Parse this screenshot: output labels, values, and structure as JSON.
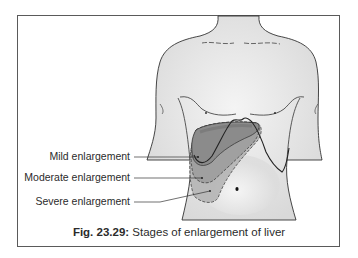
{
  "figure": {
    "caption_number": "Fig. 23.29:",
    "caption_text": "Stages of enlargement of liver",
    "labels": [
      {
        "id": "mild",
        "text": "Mild enlargement"
      },
      {
        "id": "moderate",
        "text": "Moderate enlargement"
      },
      {
        "id": "severe",
        "text": "Severe enlargement"
      }
    ],
    "colors": {
      "frame": "#5a5a5a",
      "skin": "#e6e6e6",
      "outline": "#333333",
      "liver_mild": "#8c8c8c",
      "liver_moderate": "#9e9e9e",
      "liver_severe": "#b0b0b0"
    }
  }
}
